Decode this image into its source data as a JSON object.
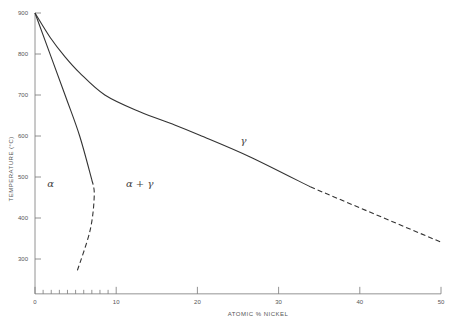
{
  "chart_data": {
    "type": "line",
    "title": "",
    "xlabel": "ATOMIC % NICKEL",
    "ylabel": "TEMPERATURE (°C)",
    "xlim": [
      0,
      50
    ],
    "ylim": [
      215,
      900
    ],
    "grid": false,
    "x_ticks": [
      0,
      10,
      20,
      30,
      40,
      50
    ],
    "x_tick_labels": [
      "0",
      "10",
      "20",
      "30",
      "40",
      "50"
    ],
    "x_minor_ticks": [
      1,
      2,
      3,
      4,
      5,
      6,
      7,
      8,
      9
    ],
    "y_ticks": [
      300,
      400,
      500,
      600,
      700,
      800,
      900
    ],
    "y_tick_labels": [
      "300",
      "400",
      "500",
      "600",
      "700",
      "800",
      "900"
    ],
    "series": [
      {
        "name": "gamma-boundary-solid",
        "style": "solid",
        "x": [
          0,
          1.85,
          3.7,
          5.5,
          8.6,
          12.9,
          17.2,
          20.3,
          26.5,
          33.9
        ],
        "y": [
          900,
          841,
          793,
          754,
          700,
          659,
          627,
          602,
          549,
          476
        ]
      },
      {
        "name": "gamma-boundary-dashed",
        "style": "dashed",
        "x": [
          33.9,
          50
        ],
        "y": [
          476,
          341
        ]
      },
      {
        "name": "alpha-boundary-solid",
        "style": "solid",
        "x": [
          0,
          3.7,
          5.5,
          7.0
        ],
        "y": [
          900,
          700,
          600,
          493
        ]
      },
      {
        "name": "alpha-boundary-dashed",
        "style": "dashed",
        "x": [
          7.0,
          7.3,
          6.8,
          5.2
        ],
        "y": [
          493,
          456,
          371,
          271
        ]
      }
    ],
    "annotations": [
      {
        "text": "α",
        "x": 1.5,
        "y": 475
      },
      {
        "text": "α + γ",
        "x": 11.2,
        "y": 475
      },
      {
        "text": "γ",
        "x": 25.3,
        "y": 580
      }
    ]
  }
}
